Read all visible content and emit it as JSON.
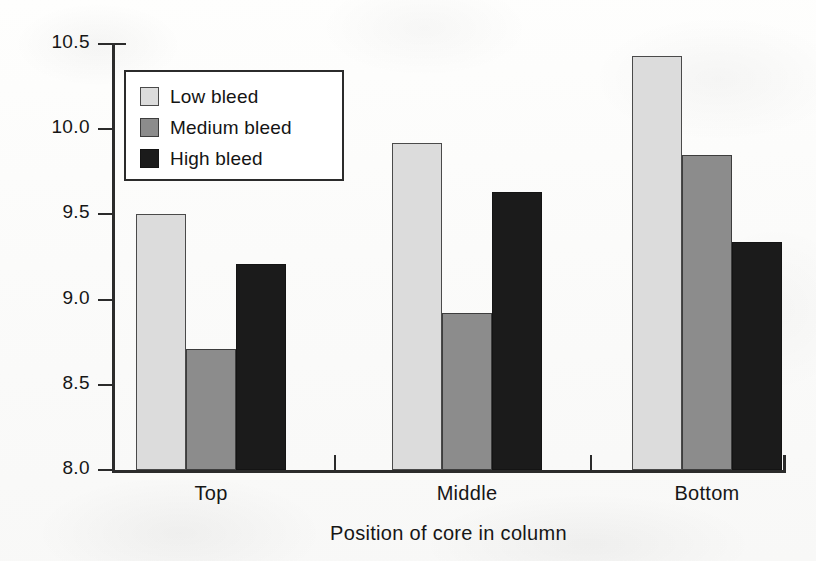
{
  "chart_data": {
    "type": "bar",
    "title": "",
    "xlabel": "Position of core in column",
    "ylabel": "OPI (Log)",
    "categories": [
      "Top",
      "Middle",
      "Bottom"
    ],
    "series": [
      {
        "name": "Low bleed",
        "values": [
          9.5,
          9.92,
          10.43
        ],
        "color": "#dcdcdc"
      },
      {
        "name": "Medium bleed",
        "values": [
          8.71,
          8.92,
          9.85
        ],
        "color": "#8c8c8c"
      },
      {
        "name": "High bleed",
        "values": [
          9.21,
          9.63,
          9.34
        ],
        "color": "#1b1b1b"
      }
    ],
    "ylim": [
      8.0,
      10.5
    ],
    "yticks": [
      "8.0",
      "8.5",
      "9.0",
      "9.5",
      "10.0",
      "10.5"
    ],
    "ytick_values": [
      8.0,
      8.5,
      9.0,
      9.5,
      10.0,
      10.5
    ],
    "grid": false,
    "legend_position": "upper-left-inside",
    "bar_group_order": [
      "Low bleed",
      "Medium bleed",
      "High bleed"
    ]
  },
  "legend": {
    "items": [
      {
        "label": "Low bleed",
        "swatch": "low"
      },
      {
        "label": "Medium bleed",
        "swatch": "medium"
      },
      {
        "label": "High bleed",
        "swatch": "high"
      }
    ]
  },
  "axes": {
    "y_title": "OPI (Log)",
    "x_title": "Position of core in column"
  }
}
